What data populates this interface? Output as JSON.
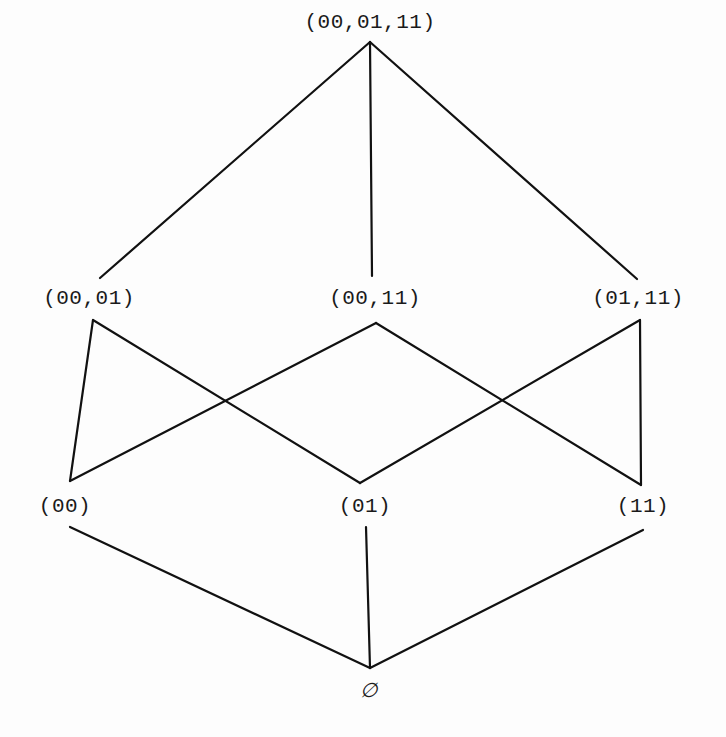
{
  "diagram": {
    "type": "hasse-diagram",
    "colors": {
      "line": "#111111",
      "text": "#1a1a1a",
      "background": "#fdfdfd"
    },
    "nodes": {
      "top": {
        "label": "(00,01,11)",
        "x": 370,
        "y": 22
      },
      "pair_00_01": {
        "label": "(00,01)",
        "x": 89,
        "y": 298
      },
      "pair_00_11": {
        "label": "(00,11)",
        "x": 375,
        "y": 298
      },
      "pair_01_11": {
        "label": "(01,11)",
        "x": 638,
        "y": 298
      },
      "single_00": {
        "label": "(00)",
        "x": 65,
        "y": 506
      },
      "single_01": {
        "label": "(01)",
        "x": 365,
        "y": 506
      },
      "single_11": {
        "label": "(11)",
        "x": 643,
        "y": 506
      },
      "empty": {
        "label": "∅",
        "x": 369,
        "y": 690
      }
    },
    "edges": [
      {
        "from": "top",
        "to": "pair_00_01",
        "x1": 370,
        "y1": 42,
        "x2": 100,
        "y2": 278
      },
      {
        "from": "top",
        "to": "pair_00_11",
        "x1": 370,
        "y1": 42,
        "x2": 372,
        "y2": 276
      },
      {
        "from": "top",
        "to": "pair_01_11",
        "x1": 370,
        "y1": 42,
        "x2": 637,
        "y2": 279
      },
      {
        "from": "pair_00_01",
        "to": "single_00",
        "x1": 93,
        "y1": 320,
        "x2": 70,
        "y2": 481
      },
      {
        "from": "pair_00_01",
        "to": "single_01",
        "x1": 93,
        "y1": 320,
        "x2": 360,
        "y2": 483
      },
      {
        "from": "pair_00_11",
        "to": "single_00",
        "x1": 376,
        "y1": 323,
        "x2": 70,
        "y2": 481
      },
      {
        "from": "pair_00_11",
        "to": "single_11",
        "x1": 376,
        "y1": 323,
        "x2": 641,
        "y2": 485
      },
      {
        "from": "pair_01_11",
        "to": "single_01",
        "x1": 640,
        "y1": 320,
        "x2": 360,
        "y2": 483
      },
      {
        "from": "pair_01_11",
        "to": "single_11",
        "x1": 640,
        "y1": 320,
        "x2": 641,
        "y2": 485
      },
      {
        "from": "single_00",
        "to": "empty",
        "x1": 70,
        "y1": 527,
        "x2": 370,
        "y2": 668
      },
      {
        "from": "single_01",
        "to": "empty",
        "x1": 366,
        "y1": 527,
        "x2": 370,
        "y2": 668
      },
      {
        "from": "single_11",
        "to": "empty",
        "x1": 643,
        "y1": 530,
        "x2": 370,
        "y2": 668
      }
    ]
  }
}
